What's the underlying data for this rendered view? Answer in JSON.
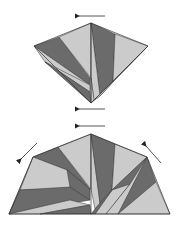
{
  "diagram": {
    "type": "origami-folding-steps",
    "steps": [
      {
        "id": "step-1",
        "shape": "kite",
        "arrows": [
          {
            "name": "top-left-arrow",
            "direction": "left"
          },
          {
            "name": "bottom-left-arrow",
            "direction": "left"
          }
        ]
      },
      {
        "id": "step-2",
        "shape": "trapezoid-fan",
        "arrows": [
          {
            "name": "top-left-arrow",
            "direction": "left"
          },
          {
            "name": "down-left-arrow",
            "direction": "down-left"
          },
          {
            "name": "up-left-arrow",
            "direction": "up-left"
          }
        ]
      }
    ],
    "colors": {
      "dark": "#6b6b6b",
      "light": "#cbcbcb",
      "background": "#ffffff"
    }
  }
}
